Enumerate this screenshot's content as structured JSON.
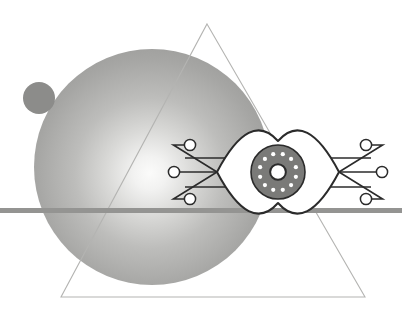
{
  "artwork": {
    "title": "Abstract Cyber Eye Composition",
    "width": 402,
    "height": 315,
    "background_color": "#ffffff",
    "description": "Monochrome flat illustration: a large gradient sphere and a small solid circle overlaid by a thin outlined triangle, a horizontal gray bar, and a stylized technological eye with circuit-board traces."
  },
  "palette": {
    "background": "#ffffff",
    "sphere_highlight": "#f7f7f6",
    "sphere_mid": "#a8a8a6",
    "sphere_edge": "#8e8e8c",
    "small_circle": "#8c8c8a",
    "triangle_stroke": "#b4b4b2",
    "horizontal_bar": "#949492",
    "eye_outline": "#2b2b2b",
    "eye_fill": "#ffffff",
    "iris_fill": "#7a7a78",
    "iris_stroke": "#2b2b2b",
    "iris_dot": "#ffffff",
    "pupil_stroke": "#2b2b2b",
    "pupil_fill": "#ffffff",
    "circuit_stroke": "#2b2b2b",
    "circuit_node_fill": "#ffffff"
  },
  "shapes": {
    "triangle": {
      "name": "triangle-outline",
      "apex_x": 207,
      "apex_y": 24,
      "base_left_x": 61,
      "base_left_y": 297,
      "base_right_x": 365,
      "base_right_y": 297,
      "stroke_width": 1.1,
      "fill": "none"
    },
    "sphere": {
      "name": "gradient-sphere",
      "center_x": 152,
      "center_y": 167,
      "radius": 118,
      "highlight_x": 150,
      "highlight_y": 173,
      "highlight_radius": 14
    },
    "small_circle": {
      "name": "small-circle",
      "center_x": 39,
      "center_y": 98,
      "radius": 16
    },
    "horizontal_bar": {
      "name": "horizontal-bar",
      "x": 0,
      "y": 208,
      "width": 402,
      "height": 5
    }
  },
  "eye": {
    "name": "cyber-eye",
    "center_x": 278,
    "center_y": 172,
    "half_width": 61,
    "half_height": 31,
    "outline_width": 2.0,
    "iris": {
      "center_x": 278,
      "center_y": 172,
      "radius": 27,
      "stroke_width": 1.6,
      "dot_count": 12,
      "dot_radius": 2.1,
      "dot_orbit_radius": 18.5
    },
    "pupil": {
      "center_x": 278,
      "center_y": 172,
      "outer_radius": 9.5,
      "inner_radius": 6.2,
      "stroke_width": 2.0
    }
  },
  "circuitry": {
    "name": "circuit-traces",
    "stroke_width": 1.6,
    "node_radius": 5.6,
    "node_stroke_width": 1.5,
    "left": {
      "label": "left-circuit-branch",
      "nodes": [
        {
          "name": "node-left-upper",
          "cx": 190,
          "cy": 145
        },
        {
          "name": "node-left-middle",
          "cx": 174,
          "cy": 172
        },
        {
          "name": "node-left-lower",
          "cx": 190,
          "cy": 199
        }
      ],
      "straight_lines": [
        {
          "name": "trace-left-upper-straight",
          "x1": 185,
          "y1": 158,
          "x2": 232,
          "y2": 158
        },
        {
          "name": "trace-left-lower-straight",
          "x1": 185,
          "y1": 187,
          "x2": 232,
          "y2": 187
        }
      ]
    },
    "right": {
      "label": "right-circuit-branch",
      "nodes": [
        {
          "name": "node-right-upper",
          "cx": 366,
          "cy": 145
        },
        {
          "name": "node-right-middle",
          "cx": 382,
          "cy": 172
        },
        {
          "name": "node-right-lower",
          "cx": 366,
          "cy": 199
        }
      ],
      "straight_lines": [
        {
          "name": "trace-right-upper-straight",
          "x1": 324,
          "y1": 158,
          "x2": 371,
          "y2": 158
        },
        {
          "name": "trace-right-lower-straight",
          "x1": 324,
          "y1": 187,
          "x2": 371,
          "y2": 187
        }
      ]
    }
  }
}
